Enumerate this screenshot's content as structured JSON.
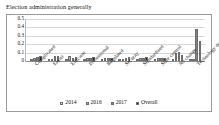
{
  "chart_data": {
    "type": "bar",
    "title": "Election administration generally",
    "xlabel": "",
    "ylabel": "",
    "ylim": [
      0,
      0.5
    ],
    "yticks": [
      "0",
      "0.1",
      "0.2",
      "0.3",
      "0.4",
      "0.5"
    ],
    "ytick_values": [
      0,
      0.1,
      0.2,
      0.3,
      0.4,
      0.5
    ],
    "grid": true,
    "legend_position": "bottom",
    "categories": [
      "Complicated",
      "Easier",
      "Efficient",
      "Professional",
      "Regulated",
      "Security",
      "Standardised",
      "State control",
      "No change",
      "Technology driven"
    ],
    "series": [
      {
        "name": "2014",
        "color": "#d9d9d9",
        "values": [
          0.015,
          0.01,
          0.02,
          0.01,
          0.015,
          0.01,
          0.015,
          0.02,
          0.025,
          0.02
        ]
      },
      {
        "name": "2016",
        "color": "#a6a6a6",
        "values": [
          0.04,
          0.025,
          0.055,
          0.03,
          0.03,
          0.025,
          0.035,
          0.03,
          0.1,
          0.025
        ]
      },
      {
        "name": "2017",
        "color": "#808080",
        "values": [
          0.045,
          0.055,
          0.03,
          0.035,
          0.035,
          0.035,
          0.04,
          0.035,
          0.11,
          0.38
        ]
      },
      {
        "name": "Overall",
        "color": "#262626",
        "values": [
          0.055,
          0.06,
          0.045,
          0.045,
          0.03,
          0.05,
          0.05,
          0.04,
          0.075,
          0.24
        ]
      }
    ]
  }
}
